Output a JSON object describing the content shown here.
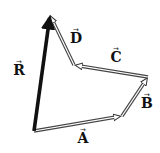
{
  "diagram": {
    "colors": {
      "background": "#ffffff",
      "resultant": "#111111",
      "component_outline": "#333333",
      "component_fill": "#ffffff"
    },
    "points": {
      "origin": [
        34,
        131
      ],
      "A_tip": [
        122,
        116
      ],
      "B_tip": [
        148,
        77
      ],
      "C_tip": [
        74,
        65
      ],
      "D_tip": [
        50,
        15
      ]
    },
    "vectors": [
      {
        "name": "A",
        "label": "A",
        "arrow_symbol": "→",
        "from": "origin",
        "to": "A_tip",
        "style": "hollow",
        "label_pos": [
          83,
          143
        ]
      },
      {
        "name": "B",
        "label": "B",
        "arrow_symbol": "→",
        "from": "A_tip",
        "to": "B_tip",
        "style": "hollow",
        "label_pos": [
          147,
          108
        ]
      },
      {
        "name": "C",
        "label": "C",
        "arrow_symbol": "→",
        "from": "B_tip",
        "to": "C_tip",
        "style": "hollow",
        "label_pos": [
          116,
          62
        ]
      },
      {
        "name": "D",
        "label": "D",
        "arrow_symbol": "→",
        "from": "C_tip",
        "to": "D_tip",
        "style": "hollow",
        "label_pos": [
          76,
          43
        ]
      },
      {
        "name": "R",
        "label": "R",
        "arrow_symbol": "→",
        "from": "origin",
        "to": "D_tip",
        "style": "solid-thick",
        "label_pos": [
          19,
          75
        ]
      }
    ]
  }
}
